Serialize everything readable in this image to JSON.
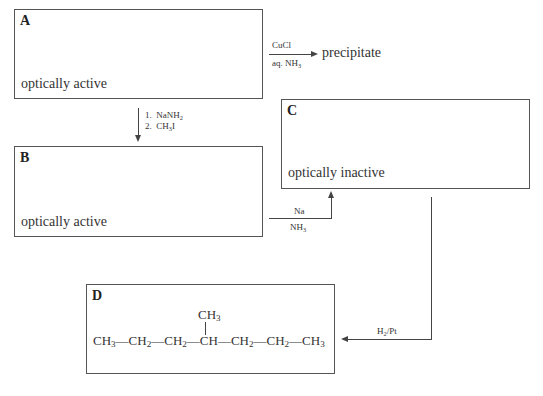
{
  "boxes": {
    "A": {
      "label": "A",
      "description": "optically active"
    },
    "B": {
      "label": "B",
      "description": "optically active"
    },
    "C": {
      "label": "C",
      "description": "optically inactive"
    },
    "D": {
      "label": "D"
    }
  },
  "reactions": {
    "A_to_precipitate": {
      "reagent_top": "CuCl",
      "reagent_bottom_main": "aq. NH",
      "reagent_bottom_sub": "3",
      "product": "precipitate"
    },
    "A_to_B": {
      "step1_num": "1.",
      "step1_main": "NaNH",
      "step1_sub": "2",
      "step2_num": "2.",
      "step2_main": "CH",
      "step2_sub": "3",
      "step2_tail": "I"
    },
    "B_to_C": {
      "reagent_top": "Na",
      "reagent_bottom_main": "NH",
      "reagent_bottom_sub": "3"
    },
    "C_to_D": {
      "reagent_main": "H",
      "reagent_sub": "2",
      "reagent_tail": "/Pt"
    }
  },
  "structure_D": {
    "branch_main": "CH",
    "branch_sub": "3",
    "chain": [
      {
        "main": "CH",
        "sub": "3"
      },
      {
        "main": "CH",
        "sub": "2"
      },
      {
        "main": "CH",
        "sub": "2"
      },
      {
        "main": "CH",
        "sub": ""
      },
      {
        "main": "CH",
        "sub": "2"
      },
      {
        "main": "CH",
        "sub": "2"
      },
      {
        "main": "CH",
        "sub": "3"
      }
    ],
    "bond": "—"
  }
}
